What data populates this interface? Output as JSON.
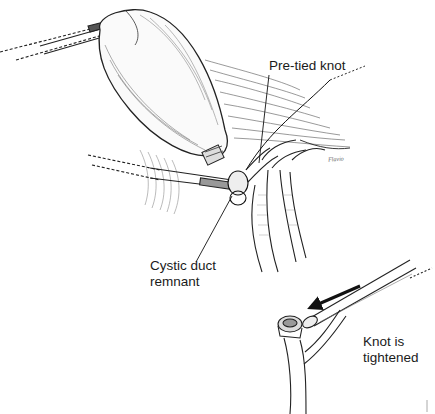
{
  "figure": {
    "type": "surgical-illustration",
    "style": "black-and-white pen and ink line drawing",
    "colors": {
      "background": "#ffffff",
      "ink": "#1a1a1a",
      "hatching": "#444444"
    }
  },
  "labels": {
    "pre_tied_knot": "Pre-tied knot",
    "cystic_duct_remnant": "Cystic duct\nremnant",
    "knot_is_tightened": "Knot is\ntightened"
  },
  "signature": "Flavio",
  "elements": {
    "main_view": [
      "grasper-instrument-upper",
      "gallbladder",
      "liver-edge",
      "clip-on-gallbladder-neck",
      "loop-ligature-pusher",
      "cystic-duct",
      "common-bile-duct",
      "hepatic-arteries"
    ],
    "inset_view": [
      "knot-pusher-instrument",
      "direction-arrow",
      "ligated-cystic-duct-stump",
      "bile-duct-branch"
    ]
  }
}
